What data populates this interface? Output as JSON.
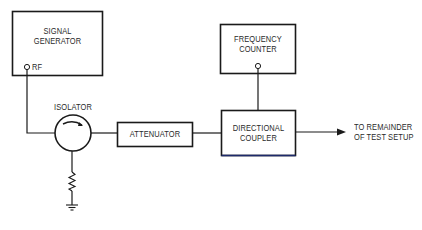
{
  "diagram": {
    "type": "block-diagram",
    "colors": {
      "stroke": "#1a1a1a",
      "text": "#2a2a2a",
      "accent_edge": "#1d2a6b",
      "background": "#ffffff"
    },
    "blocks": {
      "signal_generator": {
        "line1": "SIGNAL",
        "line2": "GENERATOR",
        "port_label": "RF"
      },
      "frequency_counter": {
        "line1": "FREQUENCY",
        "line2": "COUNTER"
      },
      "isolator": {
        "label": "ISOLATOR"
      },
      "attenuator": {
        "label": "ATTENUATOR"
      },
      "directional_coupler": {
        "line1": "DIRECTIONAL",
        "line2": "COUPLER"
      }
    },
    "output": {
      "line1": "TO REMAINDER",
      "line2": "OF TEST SETUP"
    },
    "connections": [
      {
        "from": "signal_generator.RF",
        "to": "isolator.in"
      },
      {
        "from": "isolator.out",
        "to": "attenuator"
      },
      {
        "from": "isolator.termination",
        "to": "resistor-to-ground"
      },
      {
        "from": "attenuator",
        "to": "directional_coupler"
      },
      {
        "from": "directional_coupler.coupled",
        "to": "frequency_counter"
      },
      {
        "from": "directional_coupler.out",
        "to": "output"
      }
    ]
  }
}
